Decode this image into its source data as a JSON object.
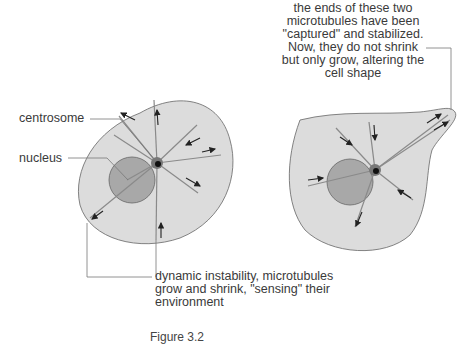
{
  "labels": {
    "centrosome": "centrosome",
    "nucleus": "nucleus",
    "top_note": "the ends of these two microtubules have been \"captured\" and stabilized. Now, they do not shrink but only grow, altering the cell shape",
    "bottom_note": "dynamic instability, microtubules grow and shrink, \"sensing\" their environment"
  },
  "caption": "Figure 3.2",
  "colors": {
    "cytoplasm": "#dcdcdc",
    "nucleus": "#a8a8a8",
    "outline": "#666666",
    "microtubule": "#8a8a8a",
    "arrow": "#222222",
    "leader": "#777777"
  }
}
